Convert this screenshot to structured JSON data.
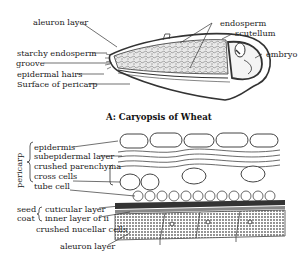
{
  "figure": {
    "title": "A: Caryopsis of Wheat",
    "top_diagram": {
      "labels_left": [
        "aleuron layer",
        "starchy endosperm",
        "groove",
        "epidermal hairs",
        "Surface of pericarp"
      ],
      "labels_right": [
        "endosperm",
        "scutellum",
        "embryo"
      ]
    },
    "bottom_diagram": {
      "group_pericarp": "pericarp",
      "pericarp_layers": [
        "epidermis",
        "subepidermal layer",
        "crushed parenchyma",
        "cross cells",
        "tube cell"
      ],
      "group_seed_coat_line1": "seed",
      "group_seed_coat_line2": "coat",
      "seed_coat_layers": [
        "cuticular layer",
        "inner layer of ii"
      ],
      "other_layers": [
        "crushed nucellar cells",
        "aleuron layer"
      ]
    }
  }
}
